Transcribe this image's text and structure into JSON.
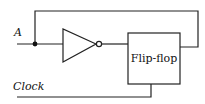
{
  "diagram": {
    "input_label": "A",
    "block_label": "Flip-flop",
    "clock_label": "Clock",
    "components": [
      "input A",
      "junction dot",
      "NOT gate (inverter)",
      "Flip-flop",
      "feedback loop",
      "Clock input"
    ],
    "connections": [
      {
        "from": "A",
        "to": "inverter"
      },
      {
        "from": "inverter",
        "to": "Flip-flop"
      },
      {
        "from": "Flip-flop output",
        "to": "A junction (feedback)"
      },
      {
        "from": "Clock",
        "to": "Flip-flop bottom"
      }
    ]
  }
}
